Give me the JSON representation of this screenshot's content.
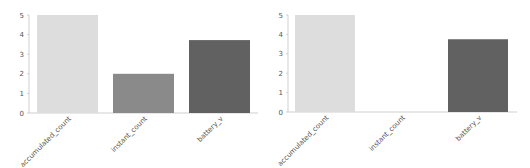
{
  "chart_data": [
    {
      "type": "bar",
      "title": "",
      "xlabel": "",
      "ylabel": "",
      "categories": [
        "accumulated_count",
        "instant_count",
        "battery_v"
      ],
      "values": [
        5,
        2,
        3.72
      ],
      "colors": [
        "#dddddd",
        "#8a8a8a",
        "#616161"
      ],
      "ylim": [
        0,
        5
      ],
      "yticks": [
        0,
        1,
        2,
        3,
        4,
        5
      ],
      "grid": false,
      "legend": null
    },
    {
      "type": "bar",
      "title": "",
      "xlabel": "",
      "ylabel": "",
      "categories": [
        "accumulated_count",
        "instant_count",
        "battery_v"
      ],
      "values": [
        5,
        0,
        3.75
      ],
      "colors": [
        "#dddddd",
        "#8a8a8a",
        "#616161"
      ],
      "ylim": [
        0,
        5
      ],
      "yticks": [
        0,
        1,
        2,
        3,
        4,
        5
      ],
      "grid": false,
      "legend": null
    }
  ],
  "layout": {
    "panels": [
      {
        "left": 0,
        "plot_x0": 30,
        "plot_x1": 258,
        "plot_y_top": 15,
        "plot_y_bottom": 113,
        "bar_width": 61,
        "bar_centers": [
          67.5,
          143.5,
          219.5
        ],
        "tick_label_x": 24
      },
      {
        "left": 265,
        "plot_x0": 24,
        "plot_x1": 252,
        "plot_y_top": 15,
        "plot_y_bottom": 112,
        "bar_width": 60,
        "bar_centers": [
          60,
          136.5,
          213
        ],
        "tick_label_x": 18
      }
    ],
    "axis_color": "#cfcfcf"
  }
}
